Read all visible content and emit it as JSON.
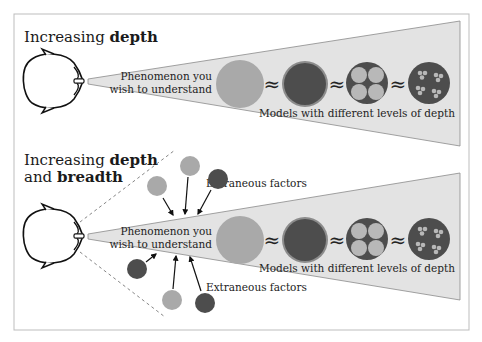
{
  "panels": [
    {
      "title_prefix": "Increasing ",
      "title_bold": "depth",
      "title_line2_prefix": "",
      "title_line2_bold": "",
      "phenomenon_line1": "Phenomenon you",
      "phenomenon_line2": "wish to understand",
      "models_label": "Models with different levels of depth"
    },
    {
      "title_prefix": "Increasing ",
      "title_bold": "depth",
      "title_line2_prefix": "and ",
      "title_line2_bold": "breadth",
      "phenomenon_line1": "Phenomenon you",
      "phenomenon_line2": "wish to understand",
      "models_label": "Models with different levels of depth",
      "extraneous_label_top": "Extraneous factors",
      "extraneous_label_bottom": "Extraneous factors"
    }
  ],
  "approx_symbol": "≈",
  "colors": {
    "cone_fill": "#e3e3e3",
    "cone_stroke": "#8a8a8a",
    "circle_light": "#a9a9a9",
    "circle_dark": "#4d4d4d",
    "circle_dark_halo": "#8c8c8c",
    "subcircle_light": "#b8b8b8",
    "frame": "#bdbdbd"
  }
}
